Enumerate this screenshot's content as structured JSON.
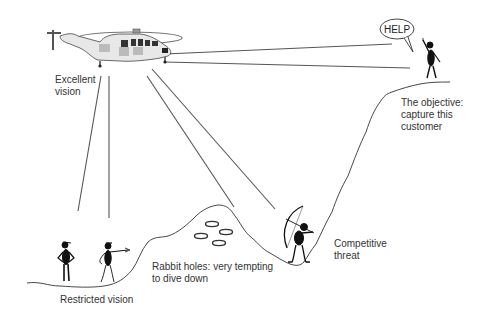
{
  "diagram": {
    "title": "",
    "labels": {
      "helicopter": "Excellent\nvision",
      "objective": "The objective:\ncapture this\ncustomer",
      "speech_bubble": "HELP",
      "restricted": "Restricted vision",
      "rabbit_holes": "Rabbit holes: very tempting\nto dive down",
      "competitor": "Competitive\nthreat"
    },
    "nodes": [
      {
        "id": "helicopter",
        "role": "observer with excellent vision",
        "icon": "helicopter-icon"
      },
      {
        "id": "customer",
        "role": "objective on the cliff top",
        "icon": "stick-figure-waving-icon"
      },
      {
        "id": "archer",
        "role": "competitive threat in the valley",
        "icon": "archer-icon"
      },
      {
        "id": "ground-people",
        "role": "two figures with restricted vision",
        "icon": "stick-figures-icon"
      },
      {
        "id": "rabbit-holes",
        "role": "distractions on the hill",
        "count": 4,
        "icon": "hole-icon"
      }
    ],
    "edges": [
      {
        "from": "helicopter",
        "to": "speech_bubble",
        "type": "sight-line"
      },
      {
        "from": "helicopter",
        "to": "customer",
        "type": "sight-line"
      },
      {
        "from": "helicopter",
        "to": "rabbit-holes",
        "type": "sight-line"
      },
      {
        "from": "helicopter",
        "to": "archer",
        "type": "sight-line"
      },
      {
        "from": "helicopter",
        "to": "ground-people",
        "type": "sight-line"
      },
      {
        "from": "helicopter",
        "to": "ground-people",
        "type": "sight-line"
      }
    ]
  }
}
